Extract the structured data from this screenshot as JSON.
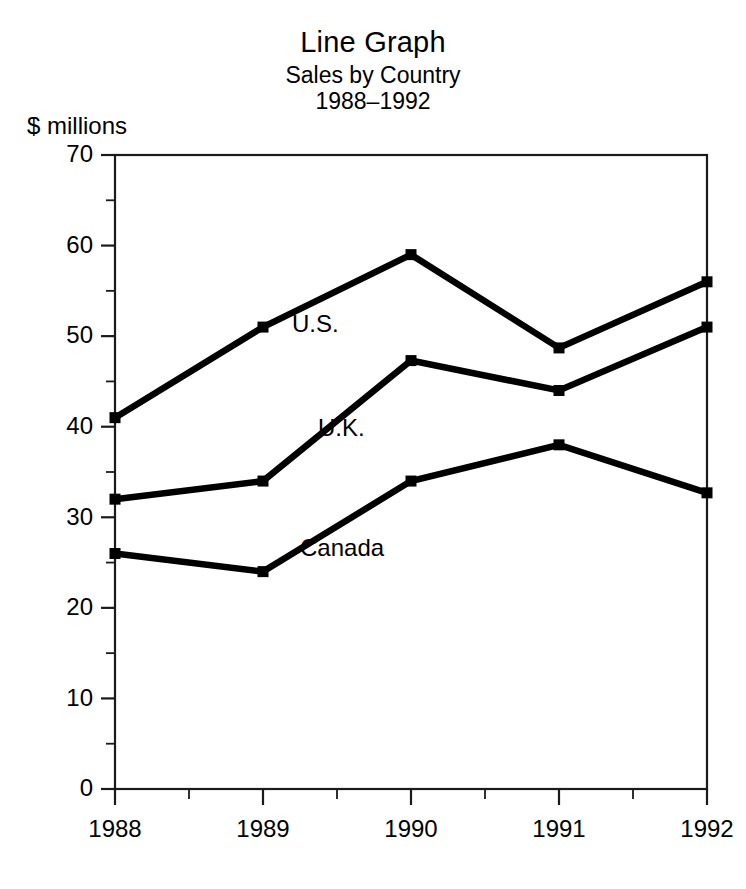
{
  "chart_data": {
    "type": "line",
    "title": "Line Graph",
    "subtitle_1": "Sales by Country",
    "subtitle_2": "1988–1992",
    "ylabel": "$ millions",
    "xlabel": "",
    "grid": false,
    "legend_position": "inline-series-labels",
    "x": [
      "1988",
      "1989",
      "1990",
      "1991",
      "1992"
    ],
    "categories": [
      "1988",
      "1989",
      "1990",
      "1991",
      "1992"
    ],
    "xlim": [
      "1988",
      "1992"
    ],
    "ylim": [
      0,
      70
    ],
    "y_major_ticks": [
      "0",
      "10",
      "20",
      "30",
      "40",
      "50",
      "60",
      "70"
    ],
    "y_minor_tick_values": [
      5,
      15,
      25,
      35,
      45,
      55,
      65
    ],
    "x_minor_tick_values": [
      1988.5,
      1989.5,
      1990.5,
      1991.5
    ],
    "marker": "square",
    "series": [
      {
        "name": "U.S.",
        "label": "U.S.",
        "color": "#000000",
        "values": [
          41,
          51,
          59,
          48.7,
          56
        ]
      },
      {
        "name": "U.K.",
        "label": "U.K.",
        "color": "#000000",
        "values": [
          32,
          34,
          47.3,
          44,
          51
        ]
      },
      {
        "name": "Canada",
        "label": "Canada",
        "color": "#000000",
        "values": [
          26,
          24,
          34,
          38,
          32.7
        ]
      }
    ],
    "annotations": [
      {
        "text": "U.S.",
        "x": 292,
        "y": 332
      },
      {
        "text": "U.K.",
        "x": 318,
        "y": 436
      },
      {
        "text": "Canada",
        "x": 300,
        "y": 556
      }
    ]
  }
}
